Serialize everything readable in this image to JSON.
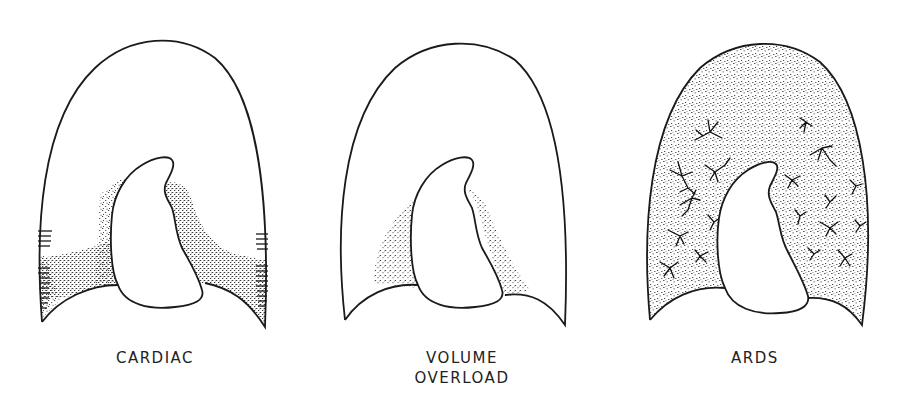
{
  "figure": {
    "panels": [
      {
        "id": "cardiac",
        "label_lines": [
          "CARDIAC"
        ],
        "features": [
          "basal-perihilar-edema",
          "kerley-b-lines",
          "heart-silhouette"
        ]
      },
      {
        "id": "volume-overload",
        "label_lines": [
          "VOLUME",
          "OVERLOAD"
        ],
        "features": [
          "perihilar-edema",
          "heart-silhouette"
        ]
      },
      {
        "id": "ards",
        "label_lines": [
          "ARDS"
        ],
        "features": [
          "diffuse-patchy-opacity",
          "air-bronchograms",
          "heart-silhouette"
        ]
      }
    ],
    "colors": {
      "ink": "#1a1a1a",
      "stipple": "#333333",
      "background": "#ffffff"
    }
  }
}
